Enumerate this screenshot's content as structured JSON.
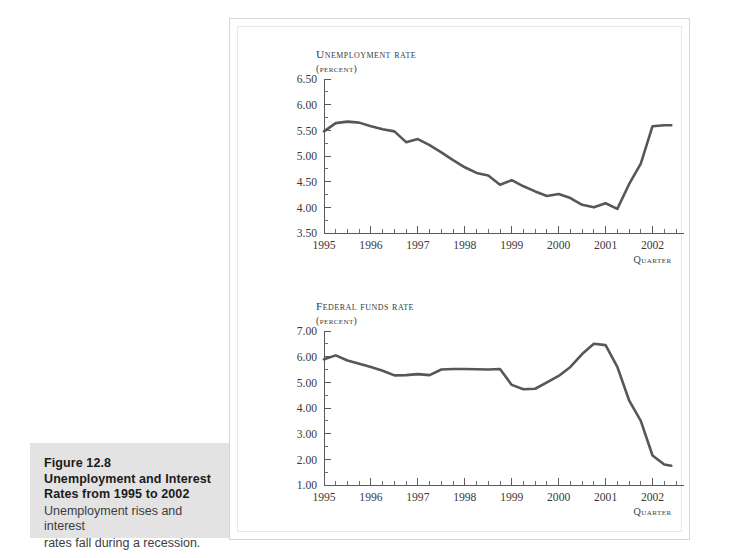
{
  "caption": {
    "figure_number": "Figure 12.8",
    "title_line1": "Unemployment and Interest",
    "title_line2": "Rates from 1995 to 2002",
    "body_line1": "Unemployment rises and interest",
    "body_line2": "rates fall during a recession."
  },
  "colors": {
    "line": "#575757",
    "axis": "#5a5a5a",
    "caption_background": "#e3e3e3",
    "panel_background": "#ffffff",
    "page_background": "#ffffff"
  },
  "chart_data": [
    {
      "id": "unemployment",
      "type": "line",
      "title": "Unemployment rate",
      "unit_label": "(percent)",
      "xlabel": "Quarter",
      "ylabel": "",
      "ylim": [
        3.5,
        6.5
      ],
      "xlim": [
        1995.0,
        2002.5
      ],
      "ytick_labels": [
        "6.50",
        "6.00",
        "5.50",
        "5.00",
        "4.50",
        "4.00",
        "3.50"
      ],
      "ytick_values": [
        6.5,
        6.0,
        5.5,
        5.0,
        4.5,
        4.0,
        3.5
      ],
      "yminor_step": 0.25,
      "xtick_labels": [
        "1995",
        "1996",
        "1997",
        "1998",
        "1999",
        "2000",
        "2001",
        "2002"
      ],
      "xtick_values": [
        1995,
        1996,
        1997,
        1998,
        1999,
        2000,
        2001,
        2002
      ],
      "xminor_per_major": 4,
      "grid": false,
      "legend": "none",
      "x": [
        1995.0,
        1995.25,
        1995.5,
        1995.75,
        1996.0,
        1996.25,
        1996.5,
        1996.75,
        1997.0,
        1997.25,
        1997.5,
        1997.75,
        1998.0,
        1998.25,
        1998.5,
        1998.75,
        1999.0,
        1999.25,
        1999.5,
        1999.75,
        2000.0,
        2000.25,
        2000.5,
        2000.75,
        2001.0,
        2001.25,
        2001.5,
        2001.75,
        2002.0,
        2002.25,
        2002.4
      ],
      "values": [
        5.48,
        5.64,
        5.67,
        5.65,
        5.58,
        5.52,
        5.48,
        5.27,
        5.33,
        5.21,
        5.07,
        4.92,
        4.78,
        4.67,
        4.62,
        4.44,
        4.53,
        4.41,
        4.31,
        4.22,
        4.26,
        4.18,
        4.05,
        4.0,
        4.08,
        3.97,
        4.45,
        4.85,
        5.58,
        5.6,
        5.6
      ]
    },
    {
      "id": "federal-funds",
      "type": "line",
      "title": "Federal funds rate",
      "unit_label": "(percent)",
      "xlabel": "Quarter",
      "ylabel": "",
      "ylim": [
        1.0,
        7.0
      ],
      "xlim": [
        1995.0,
        2002.5
      ],
      "ytick_labels": [
        "7.00",
        "6.00",
        "5.00",
        "4.00",
        "3.00",
        "2.00",
        "1.00"
      ],
      "ytick_values": [
        7.0,
        6.0,
        5.0,
        4.0,
        3.0,
        2.0,
        1.0
      ],
      "yminor_step": 0.5,
      "xtick_labels": [
        "1995",
        "1996",
        "1997",
        "1998",
        "1999",
        "2000",
        "2001",
        "2002"
      ],
      "xtick_values": [
        1995,
        1996,
        1997,
        1998,
        1999,
        2000,
        2001,
        2002
      ],
      "xminor_per_major": 4,
      "grid": false,
      "legend": "none",
      "x": [
        1995.0,
        1995.25,
        1995.5,
        1995.75,
        1996.0,
        1996.25,
        1996.5,
        1996.75,
        1997.0,
        1997.25,
        1997.5,
        1997.75,
        1998.0,
        1998.25,
        1998.5,
        1998.75,
        1999.0,
        1999.25,
        1999.5,
        1999.75,
        2000.0,
        2000.25,
        2000.5,
        2000.75,
        2001.0,
        2001.25,
        2001.5,
        2001.75,
        2002.0,
        2002.25,
        2002.4
      ],
      "values": [
        5.9,
        6.05,
        5.85,
        5.72,
        5.6,
        5.45,
        5.27,
        5.28,
        5.32,
        5.28,
        5.5,
        5.52,
        5.52,
        5.51,
        5.5,
        5.52,
        4.9,
        4.73,
        4.75,
        5.0,
        5.25,
        5.6,
        6.1,
        6.5,
        6.45,
        5.6,
        4.3,
        3.5,
        2.15,
        1.8,
        1.75
      ]
    }
  ]
}
